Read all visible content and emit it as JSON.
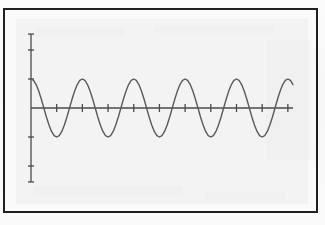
{
  "figure": {
    "title": "",
    "caption": "",
    "frame_color": "#1f1f1f",
    "page_background": "#fafafa",
    "plate_background": "#f3f3f3"
  },
  "chart_data": {
    "type": "line",
    "title": "",
    "subtitle": "",
    "xlabel": "",
    "ylabel": "",
    "legend": [],
    "legend_position": "none",
    "grid": false,
    "line_color": "#5a5a5a",
    "axis_color": "#4a4a4a",
    "line_width": 1.4,
    "axis_width": 1.3,
    "function": "y = A * cos(2*pi*x/T)",
    "amplitude": 1.0,
    "period": 2.0,
    "phase": 0.0,
    "cycles": 5.1,
    "xlim": [
      0,
      10.2
    ],
    "ylim": [
      -2.6,
      2.6
    ],
    "x_axis": {
      "y_value": 0,
      "start": 0,
      "end": 10.2,
      "tick_values": [
        1,
        2,
        3,
        4,
        5,
        6,
        7,
        8,
        9,
        10
      ],
      "tick_labels": [],
      "tick_length": 8
    },
    "y_axis": {
      "x_value": 0,
      "start": -2.55,
      "end": 2.55,
      "tick_values": [
        -2.0,
        -1.0,
        1.0,
        2.0
      ],
      "tick_labels": [],
      "tick_length": 6
    },
    "series": [
      {
        "name": "cosine",
        "x": [
          0.0,
          0.1,
          0.2,
          0.3,
          0.4,
          0.5,
          0.6,
          0.7,
          0.8,
          0.9,
          1.0,
          1.1,
          1.2,
          1.3,
          1.4,
          1.5,
          1.6,
          1.7,
          1.8,
          1.9,
          2.0,
          2.1,
          2.2,
          2.3,
          2.4,
          2.5,
          2.6,
          2.7,
          2.8,
          2.9,
          3.0,
          3.1,
          3.2,
          3.3,
          3.4,
          3.5,
          3.6,
          3.7,
          3.8,
          3.9,
          4.0,
          4.1,
          4.2,
          4.3,
          4.4,
          4.5,
          4.6,
          4.7,
          4.8,
          4.9,
          5.0,
          5.1,
          5.2,
          5.3,
          5.4,
          5.5,
          5.6,
          5.7,
          5.8,
          5.9,
          6.0,
          6.1,
          6.2,
          6.3,
          6.4,
          6.5,
          6.6,
          6.7,
          6.8,
          6.9,
          7.0,
          7.1,
          7.2,
          7.3,
          7.4,
          7.5,
          7.6,
          7.7,
          7.8,
          7.9,
          8.0,
          8.1,
          8.2,
          8.3,
          8.4,
          8.5,
          8.6,
          8.7,
          8.8,
          8.9,
          9.0,
          9.1,
          9.2,
          9.3,
          9.4,
          9.5,
          9.6,
          9.7,
          9.8,
          9.9,
          10.0,
          10.1,
          10.2
        ],
        "y": [
          1.0,
          0.951,
          0.809,
          0.588,
          0.309,
          0.0,
          -0.309,
          -0.588,
          -0.809,
          -0.951,
          -1.0,
          -0.951,
          -0.809,
          -0.588,
          -0.309,
          0.0,
          0.309,
          0.588,
          0.809,
          0.951,
          1.0,
          0.951,
          0.809,
          0.588,
          0.309,
          0.0,
          -0.309,
          -0.588,
          -0.809,
          -0.951,
          -1.0,
          -0.951,
          -0.809,
          -0.588,
          -0.309,
          0.0,
          0.309,
          0.588,
          0.809,
          0.951,
          1.0,
          0.951,
          0.809,
          0.588,
          0.309,
          0.0,
          -0.309,
          -0.588,
          -0.809,
          -0.951,
          -1.0,
          -0.951,
          -0.809,
          -0.588,
          -0.309,
          0.0,
          0.309,
          0.588,
          0.809,
          0.951,
          1.0,
          0.951,
          0.809,
          0.588,
          0.309,
          0.0,
          -0.309,
          -0.588,
          -0.809,
          -0.951,
          -1.0,
          -0.951,
          -0.809,
          -0.588,
          -0.309,
          0.0,
          0.309,
          0.588,
          0.809,
          0.951,
          1.0,
          0.951,
          0.809,
          0.588,
          0.309,
          0.0,
          -0.309,
          -0.588,
          -0.809,
          -0.951,
          -1.0,
          -0.951,
          -0.809,
          -0.588,
          -0.309,
          0.0,
          0.309,
          0.588,
          0.809,
          0.951,
          1.0,
          0.951,
          0.809
        ]
      }
    ]
  }
}
